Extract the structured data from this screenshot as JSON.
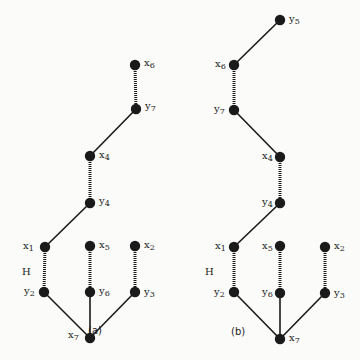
{
  "colors": {
    "node": "#1a1a1a",
    "edge": "#1a1a1a",
    "background": "#fbfbf9"
  },
  "graphs": [
    {
      "caption": "(a)",
      "caption_pos": [
        88,
        325
      ],
      "H_label": "H",
      "H_pos": [
        22,
        266
      ],
      "nodes": [
        {
          "id": "x6",
          "letter": "x",
          "sub": "6",
          "x": 135,
          "y": 65,
          "lx": 144,
          "ly": 58,
          "side": "right"
        },
        {
          "id": "y7",
          "letter": "y",
          "sub": "7",
          "x": 136,
          "y": 109,
          "lx": 145,
          "ly": 101,
          "side": "right"
        },
        {
          "id": "x4",
          "letter": "x",
          "sub": "4",
          "x": 90,
          "y": 156,
          "lx": 99,
          "ly": 150,
          "side": "right"
        },
        {
          "id": "y4",
          "letter": "y",
          "sub": "4",
          "x": 90,
          "y": 203,
          "lx": 99,
          "ly": 196,
          "side": "right"
        },
        {
          "id": "x1",
          "letter": "x",
          "sub": "1",
          "x": 45,
          "y": 247,
          "lx": 23,
          "ly": 241,
          "side": "left"
        },
        {
          "id": "x5",
          "letter": "x",
          "sub": "5",
          "x": 90,
          "y": 246,
          "lx": 99,
          "ly": 240,
          "side": "right"
        },
        {
          "id": "x2",
          "letter": "x",
          "sub": "2",
          "x": 135,
          "y": 246,
          "lx": 144,
          "ly": 240,
          "side": "right"
        },
        {
          "id": "y2",
          "letter": "y",
          "sub": "2",
          "x": 44,
          "y": 292,
          "lx": 24,
          "ly": 286,
          "side": "left"
        },
        {
          "id": "y6",
          "letter": "y",
          "sub": "6",
          "x": 90,
          "y": 292,
          "lx": 99,
          "ly": 286,
          "side": "right"
        },
        {
          "id": "y3",
          "letter": "y",
          "sub": "3",
          "x": 135,
          "y": 292,
          "lx": 144,
          "ly": 287,
          "side": "right"
        },
        {
          "id": "x7",
          "letter": "x",
          "sub": "7",
          "x": 90,
          "y": 338,
          "lx": 68,
          "ly": 330,
          "side": "left"
        }
      ],
      "edges": [
        {
          "from": "x6",
          "to": "y7",
          "style": "dotted"
        },
        {
          "from": "y7",
          "to": "x4",
          "style": "solid"
        },
        {
          "from": "x4",
          "to": "y4",
          "style": "dotted"
        },
        {
          "from": "y4",
          "to": "x1",
          "style": "solid"
        },
        {
          "from": "x1",
          "to": "y2",
          "style": "dotted"
        },
        {
          "from": "x5",
          "to": "y6",
          "style": "dotted"
        },
        {
          "from": "x2",
          "to": "y3",
          "style": "dotted"
        },
        {
          "from": "y2",
          "to": "x7",
          "style": "solid"
        },
        {
          "from": "y6",
          "to": "x7",
          "style": "solid"
        },
        {
          "from": "y3",
          "to": "x7",
          "style": "solid"
        }
      ]
    },
    {
      "caption": "(b)",
      "caption_pos": [
        231,
        326
      ],
      "H_label": "H",
      "H_pos": [
        205,
        266
      ],
      "nodes": [
        {
          "id": "y5",
          "letter": "y",
          "sub": "5",
          "x": 280,
          "y": 20,
          "lx": 289,
          "ly": 14,
          "side": "right"
        },
        {
          "id": "x6",
          "letter": "x",
          "sub": "6",
          "x": 234,
          "y": 65,
          "lx": 215,
          "ly": 59,
          "side": "left"
        },
        {
          "id": "y7",
          "letter": "y",
          "sub": "7",
          "x": 234,
          "y": 110,
          "lx": 214,
          "ly": 104,
          "side": "left"
        },
        {
          "id": "x4",
          "letter": "x",
          "sub": "4",
          "x": 280,
          "y": 157,
          "lx": 262,
          "ly": 151,
          "side": "left"
        },
        {
          "id": "y4",
          "letter": "y",
          "sub": "4",
          "x": 280,
          "y": 203,
          "lx": 262,
          "ly": 197,
          "side": "left"
        },
        {
          "id": "x1",
          "letter": "x",
          "sub": "1",
          "x": 234,
          "y": 247,
          "lx": 215,
          "ly": 241,
          "side": "left"
        },
        {
          "id": "x5",
          "letter": "x",
          "sub": "5",
          "x": 280,
          "y": 246,
          "lx": 262,
          "ly": 241,
          "side": "left"
        },
        {
          "id": "x2",
          "letter": "x",
          "sub": "2",
          "x": 325,
          "y": 247,
          "lx": 334,
          "ly": 241,
          "side": "right"
        },
        {
          "id": "y2",
          "letter": "y",
          "sub": "2",
          "x": 234,
          "y": 292,
          "lx": 214,
          "ly": 287,
          "side": "left"
        },
        {
          "id": "y6",
          "letter": "y",
          "sub": "6",
          "x": 280,
          "y": 293,
          "lx": 262,
          "ly": 287,
          "side": "left"
        },
        {
          "id": "y3",
          "letter": "y",
          "sub": "3",
          "x": 325,
          "y": 293,
          "lx": 334,
          "ly": 288,
          "side": "right"
        },
        {
          "id": "x7",
          "letter": "x",
          "sub": "7",
          "x": 280,
          "y": 339,
          "lx": 289,
          "ly": 333,
          "side": "right"
        }
      ],
      "edges": [
        {
          "from": "y5",
          "to": "x6",
          "style": "solid"
        },
        {
          "from": "x6",
          "to": "y7",
          "style": "dotted"
        },
        {
          "from": "y7",
          "to": "x4",
          "style": "solid"
        },
        {
          "from": "x4",
          "to": "y4",
          "style": "dotted"
        },
        {
          "from": "y4",
          "to": "x1",
          "style": "solid"
        },
        {
          "from": "x1",
          "to": "y2",
          "style": "dotted"
        },
        {
          "from": "x5",
          "to": "y6",
          "style": "dotted"
        },
        {
          "from": "x2",
          "to": "y3",
          "style": "dotted"
        },
        {
          "from": "y2",
          "to": "x7",
          "style": "solid"
        },
        {
          "from": "y6",
          "to": "x7",
          "style": "solid"
        },
        {
          "from": "y3",
          "to": "x7",
          "style": "solid"
        }
      ]
    }
  ]
}
